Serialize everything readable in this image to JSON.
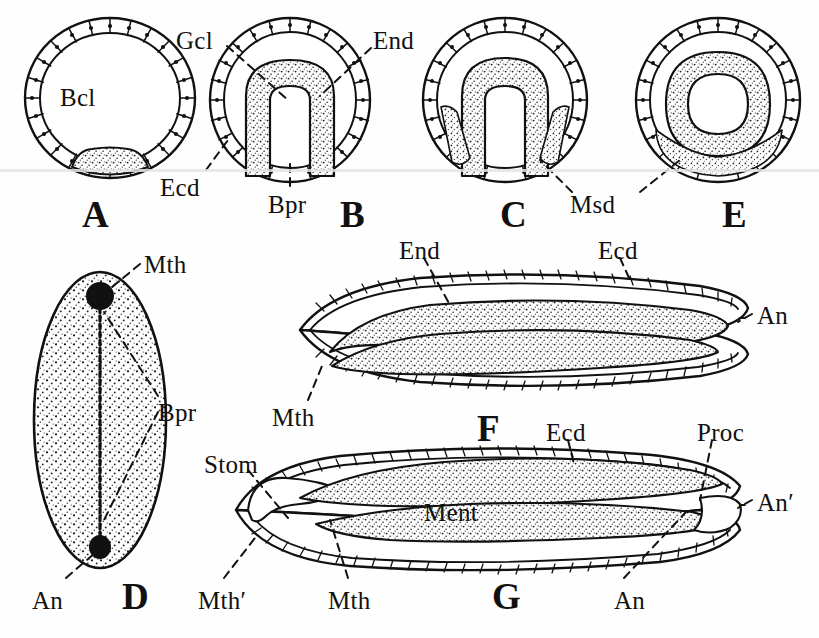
{
  "plate": {
    "title": "Gastrulation and larval development series",
    "background_color": "#fefefe",
    "ink_color": "#111111",
    "width": 819,
    "height": 638
  },
  "figure_letters": [
    {
      "id": "A",
      "label": "A",
      "x": 82,
      "y": 196
    },
    {
      "id": "B",
      "label": "B",
      "x": 340,
      "y": 196
    },
    {
      "id": "C",
      "label": "C",
      "x": 500,
      "y": 196
    },
    {
      "id": "E",
      "label": "E",
      "x": 722,
      "y": 196
    },
    {
      "id": "D",
      "label": "D",
      "x": 122,
      "y": 588
    },
    {
      "id": "F",
      "label": "F",
      "x": 477,
      "y": 418
    },
    {
      "id": "G",
      "label": "G",
      "x": 492,
      "y": 594
    }
  ],
  "annotations": [
    {
      "id": "bcl",
      "label": "Bcl",
      "x": 60,
      "y": 85,
      "figure": "A"
    },
    {
      "id": "gcl",
      "label": "Gcl",
      "x": 176,
      "y": 28,
      "figure": "B"
    },
    {
      "id": "end-b",
      "label": "End",
      "x": 373,
      "y": 28,
      "figure": "B"
    },
    {
      "id": "ecd-b",
      "label": "Ecd",
      "x": 160,
      "y": 175,
      "figure": "B"
    },
    {
      "id": "bpr-b",
      "label": "Bpr",
      "x": 268,
      "y": 192,
      "figure": "B"
    },
    {
      "id": "msd",
      "label": "Msd",
      "x": 570,
      "y": 192,
      "figure": "C/E"
    },
    {
      "id": "mth-d",
      "label": "Mth",
      "x": 144,
      "y": 252,
      "figure": "D"
    },
    {
      "id": "bpr-d",
      "label": "Bpr",
      "x": 158,
      "y": 400,
      "figure": "D"
    },
    {
      "id": "an-d",
      "label": "An",
      "x": 32,
      "y": 588,
      "figure": "D"
    },
    {
      "id": "end-f",
      "label": "End",
      "x": 399,
      "y": 238,
      "figure": "F"
    },
    {
      "id": "ecd-f",
      "label": "Ecd",
      "x": 598,
      "y": 238,
      "figure": "F"
    },
    {
      "id": "an-f",
      "label": "An",
      "x": 757,
      "y": 303,
      "figure": "F"
    },
    {
      "id": "mth-f",
      "label": "Mth",
      "x": 272,
      "y": 405,
      "figure": "F"
    },
    {
      "id": "ecd-g",
      "label": "Ecd",
      "x": 546,
      "y": 420,
      "figure": "G"
    },
    {
      "id": "proc-g",
      "label": "Proc",
      "x": 697,
      "y": 420,
      "figure": "G"
    },
    {
      "id": "stom-g",
      "label": "Stom",
      "x": 204,
      "y": 452,
      "figure": "G"
    },
    {
      "id": "anprime",
      "label": "An′",
      "x": 757,
      "y": 490,
      "figure": "G"
    },
    {
      "id": "ment-g",
      "label": "Ment",
      "x": 424,
      "y": 500,
      "figure": "G"
    },
    {
      "id": "mthprime",
      "label": "Mth′",
      "x": 198,
      "y": 588,
      "figure": "G"
    },
    {
      "id": "mth-g",
      "label": "Mth",
      "x": 328,
      "y": 588,
      "figure": "G"
    },
    {
      "id": "an-g",
      "label": "An",
      "x": 614,
      "y": 588,
      "figure": "G"
    }
  ],
  "legend_terms": {
    "Bcl": "blastocoel",
    "Gcl": "gastrocoel",
    "End": "endoderm",
    "Ecd": "ectoderm",
    "Bpr": "blastopore",
    "Msd": "mesoderm",
    "Mth": "mouth",
    "An": "anus",
    "Stom": "stomodaeum",
    "Ment": "mesenteron",
    "Proc": "proctodaeum"
  }
}
